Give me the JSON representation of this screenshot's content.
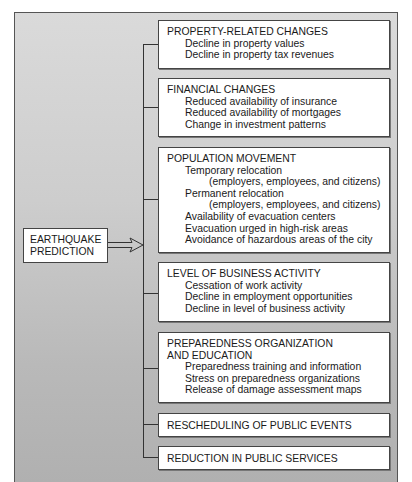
{
  "source": {
    "label_lines": [
      "EARTHQUAKE",
      "PREDICTION"
    ]
  },
  "effects": [
    {
      "heading_lines": [
        "PROPERTY-RELATED CHANGES"
      ],
      "items": [
        {
          "text": "Decline in property values"
        },
        {
          "text": "Decline in property tax revenues"
        }
      ]
    },
    {
      "heading_lines": [
        "FINANCIAL CHANGES"
      ],
      "items": [
        {
          "text": "Reduced availability of insurance"
        },
        {
          "text": "Reduced availability of mortgages"
        },
        {
          "text": "Change in investment patterns"
        }
      ]
    },
    {
      "heading_lines": [
        "POPULATION MOVEMENT"
      ],
      "items": [
        {
          "text": "Temporary relocation",
          "sub": "(employers, employees, and citizens)"
        },
        {
          "text": "Permanent relocation",
          "sub": "(employers, employees, and citizens)"
        },
        {
          "text": "Availability of evacuation centers"
        },
        {
          "text": "Evacuation urged in high-risk areas"
        },
        {
          "text": "Avoidance of hazardous areas of the city"
        }
      ]
    },
    {
      "heading_lines": [
        "LEVEL OF BUSINESS ACTIVITY"
      ],
      "items": [
        {
          "text": "Cessation of work activity"
        },
        {
          "text": "Decline in employment opportunities"
        },
        {
          "text": "Decline in level of business activity"
        }
      ]
    },
    {
      "heading_lines": [
        "PREPAREDNESS ORGANIZATION",
        "AND EDUCATION"
      ],
      "items": [
        {
          "text": "Preparedness training and information"
        },
        {
          "text": "Stress on preparedness organizations"
        },
        {
          "text": "Release of damage assessment maps"
        }
      ]
    },
    {
      "heading_lines": [
        "RESCHEDULING OF PUBLIC EVENTS"
      ],
      "items": []
    },
    {
      "heading_lines": [
        "REDUCTION IN PUBLIC SERVICES"
      ],
      "items": []
    }
  ]
}
